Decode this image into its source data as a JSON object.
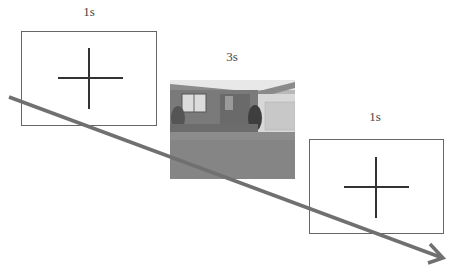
{
  "stimuli": [
    {
      "id": "fixation-1",
      "duration_label": "1s",
      "type": "fixation-cross"
    },
    {
      "id": "scene",
      "duration_label": "3s",
      "type": "photo",
      "description": "house-scene"
    },
    {
      "id": "fixation-2",
      "duration_label": "1s",
      "type": "fixation-cross"
    }
  ],
  "arrow": {
    "label": "time",
    "color": "#6e6e6e"
  }
}
